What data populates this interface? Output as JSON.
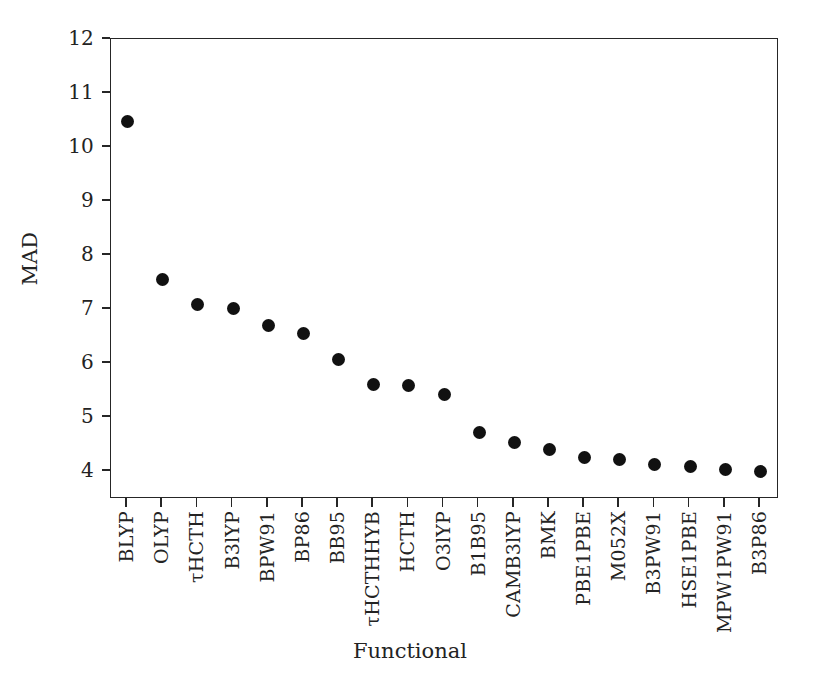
{
  "chart_data": {
    "type": "scatter",
    "title": "",
    "xlabel": "Functional",
    "ylabel": "MAD",
    "ylim": [
      3.4,
      12
    ],
    "yticks": [
      12,
      11,
      10,
      9,
      8,
      7,
      6,
      5,
      4
    ],
    "ytick_labels": [
      "12",
      "11",
      "10",
      "9",
      "8",
      "7",
      "6",
      "5",
      "4"
    ],
    "grid": false,
    "legend": null,
    "marker": {
      "shape": "circle",
      "color": "#111111",
      "size": 13
    },
    "axis_color": "#262626",
    "background": "#ffffff",
    "categories": [
      "BLYP",
      "OLYP",
      "τHCTH",
      "B3lYP",
      "BPW91",
      "BP86",
      "BB95",
      "τHCTHHYB",
      "HCTH",
      "O3lYP",
      "B1B95",
      "CAMB3lYP",
      "BMK",
      "PBE1PBE",
      "M052X",
      "B3PW91",
      "HSE1PBE",
      "MPW1PW91",
      "B3P86"
    ],
    "values": [
      10.45,
      7.52,
      7.06,
      6.99,
      6.67,
      6.53,
      6.05,
      5.58,
      5.56,
      5.39,
      4.7,
      4.51,
      4.38,
      4.24,
      4.2,
      4.1,
      4.06,
      4.01,
      3.97
    ]
  }
}
